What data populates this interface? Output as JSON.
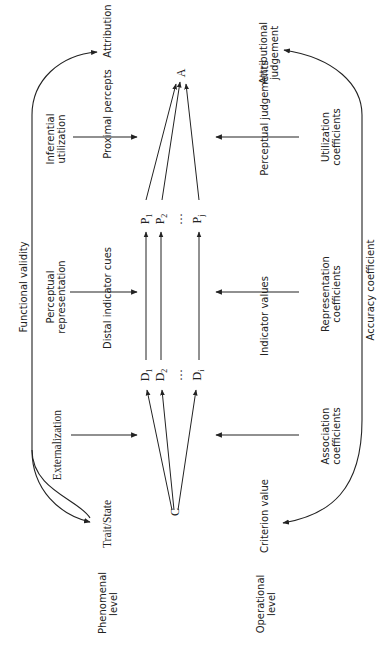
{
  "diagram": {
    "orientation": "rotated 90 degrees counter-clockwise",
    "levels": {
      "phenomenal": "Phenomenal level",
      "operational": "Operational level"
    },
    "phenomenal_row": {
      "trait_state": "Trait/State",
      "externalization": "Externalization",
      "distal_indicator_cues": "Distal indicator cues",
      "perceptual_representation": "Perceptual representation",
      "proximal_percepts": "Proximal percepts",
      "inferential_utilization": "Inferential utilization",
      "attribution": "Attribution",
      "functional_validity": "Functional validity"
    },
    "operational_row": {
      "criterion_value": "Criterion value",
      "association_coefficients": "Association coefficients",
      "indicator_values": "Indicator values",
      "representation_coefficients": "Representation coefficients",
      "perceptual_judgements": "Perceptual judgements",
      "utilization_coefficients": "Utilization coefficients",
      "attributional_judgement": "Attributional judgement",
      "accuracy_coefficient": "Accuracy coefficient"
    },
    "nodes": {
      "criterion": "C",
      "attribution": "A",
      "distal": [
        {
          "base": "D",
          "sub": "1"
        },
        {
          "base": "D",
          "sub": "2"
        },
        {
          "base": "…",
          "sub": ""
        },
        {
          "base": "D",
          "sub": "i"
        }
      ],
      "proximal": [
        {
          "base": "P",
          "sub": "1"
        },
        {
          "base": "P",
          "sub": "2"
        },
        {
          "base": "…",
          "sub": ""
        },
        {
          "base": "P",
          "sub": "j"
        }
      ]
    }
  }
}
